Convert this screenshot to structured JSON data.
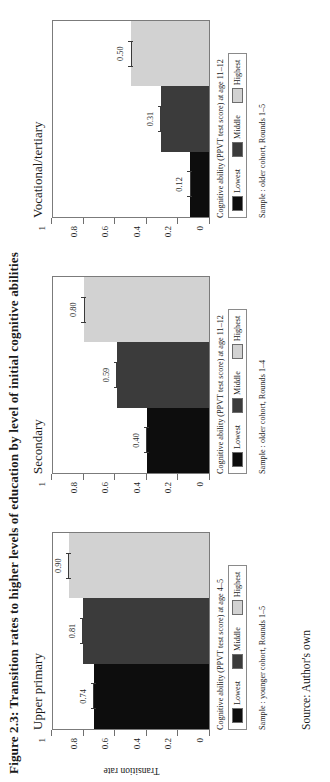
{
  "figure": {
    "title": "Figure 2.3: Transition rates to higher levels of education by level of initial cognitive abilities",
    "source": "Source: Author's own",
    "axis_title": "Transition rate",
    "y_ticks": [
      "0",
      "0.2",
      "0.4",
      "0.6",
      "0.8",
      "1"
    ],
    "colors": {
      "lowest": "#0d0d0d",
      "middle": "#3b3b3b",
      "highest": "#d2d2d2",
      "frame": "#7b7b7b"
    }
  },
  "chart_data": {
    "type": "bar",
    "title": "Figure 2.3: Transition rates to higher levels of education by level of initial cognitive abilities",
    "xlabel": "",
    "ylabel": "Transition rate",
    "ylim": [
      0,
      1
    ],
    "yticks": [
      0,
      0.2,
      0.4,
      0.6,
      0.8,
      1
    ],
    "grid": false,
    "legend_position": "below-panel",
    "categories": [
      "Lowest",
      "Middle",
      "Highest"
    ],
    "panels": [
      {
        "name": "Upper primary",
        "legend_caption": "Cognitive ability (PPVT test score) at age 4–5",
        "sample_note": "Sample : younger cohort, Rounds 1–5",
        "values": [
          0.74,
          0.81,
          0.9
        ],
        "value_labels": [
          "0.74",
          "0.81",
          "0.90"
        ]
      },
      {
        "name": "Secondary",
        "legend_caption": "Cognitive ability (PPVT test score) at age 11–12",
        "sample_note": "Sample : older cohort, Rounds 1–4",
        "values": [
          0.4,
          0.59,
          0.8
        ],
        "value_labels": [
          "0.40",
          "0.59",
          "0.80"
        ]
      },
      {
        "name": "Vocational/tertiary",
        "legend_caption": "Cognitive ability (PPVT test score) at age 11–12",
        "sample_note": "Sample : older cohort, Rounds 1–5",
        "values": [
          0.12,
          0.31,
          0.5
        ],
        "value_labels": [
          "0.12",
          "0.31",
          "0.50"
        ]
      }
    ],
    "series": [
      {
        "name": "Lowest",
        "values": [
          0.74,
          0.4,
          0.12
        ]
      },
      {
        "name": "Middle",
        "values": [
          0.81,
          0.59,
          0.31
        ]
      },
      {
        "name": "Highest",
        "values": [
          0.9,
          0.8,
          0.5
        ]
      }
    ],
    "panel_names": [
      "Upper primary",
      "Secondary",
      "Vocational/tertiary"
    ]
  }
}
